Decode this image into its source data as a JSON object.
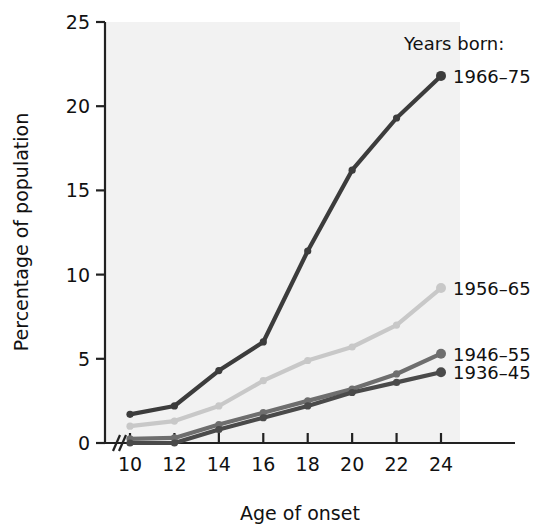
{
  "chart_data": {
    "type": "line",
    "title": "",
    "xlabel": "Age of onset",
    "ylabel": "Percentage of population",
    "legend_heading": "Years born:",
    "legend_position": "right-inline-end-of-line",
    "grid": false,
    "x": [
      10,
      12,
      14,
      16,
      18,
      20,
      22,
      24
    ],
    "xtick_labels": [
      "10",
      "12",
      "14",
      "16",
      "18",
      "20",
      "22",
      "24"
    ],
    "ytick_labels": [
      "0",
      "5",
      "10",
      "15",
      "20",
      "25"
    ],
    "ytick_values": [
      0,
      5,
      10,
      15,
      20,
      25
    ],
    "xlim": [
      10,
      24
    ],
    "ylim": [
      0,
      25
    ],
    "x_axis_break": true,
    "series": [
      {
        "name": "1966–75",
        "color": "#3c3c3c",
        "values": [
          1.7,
          2.2,
          4.3,
          6.0,
          11.4,
          16.2,
          19.3,
          21.8
        ]
      },
      {
        "name": "1956–65",
        "color": "#c8c8c8",
        "values": [
          1.0,
          1.3,
          2.2,
          3.7,
          4.9,
          5.7,
          7.0,
          9.2
        ]
      },
      {
        "name": "1946–55",
        "color": "#6e6e6e",
        "values": [
          0.25,
          0.3,
          1.1,
          1.8,
          2.5,
          3.2,
          4.1,
          5.3
        ]
      },
      {
        "name": "1936–45",
        "color": "#4a4a4a",
        "values": [
          0.0,
          0.0,
          0.8,
          1.5,
          2.2,
          3.0,
          3.6,
          4.2
        ]
      }
    ]
  },
  "plot_area": {
    "background_color": "#f2f2f2",
    "left": 105,
    "right": 460,
    "top": 22,
    "bottom": 443
  },
  "legend_labels": {
    "heading": "Years born:",
    "items": [
      "1966–75",
      "1956–65",
      "1946–55",
      "1936–45"
    ]
  }
}
